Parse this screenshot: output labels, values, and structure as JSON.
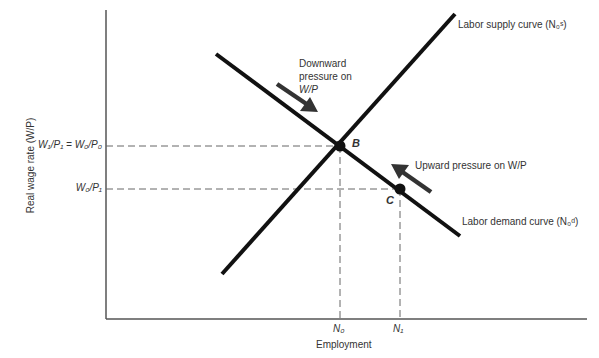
{
  "diagram": {
    "y_axis_label": "Real wage rate (W/P)",
    "x_axis_label": "Employment",
    "y_ticks": [
      {
        "id": "w1p1_eq_w0p0",
        "label": "W₁/P₁ = W₀/P₀"
      },
      {
        "id": "w0p1",
        "label": "W₀/P₁"
      }
    ],
    "x_ticks": [
      {
        "id": "n0",
        "label": "N₀"
      },
      {
        "id": "n1",
        "label": "N₁"
      }
    ],
    "curves": [
      {
        "id": "supply",
        "label": "Labor supply curve (N₀ˢ)"
      },
      {
        "id": "demand",
        "label": "Labor demand curve (N₀ᵈ)"
      }
    ],
    "points": [
      {
        "id": "B",
        "label": "B"
      },
      {
        "id": "C",
        "label": "C"
      }
    ],
    "annotations": [
      {
        "id": "downward",
        "lines": [
          "Downward",
          "pressure on",
          "W/P"
        ]
      },
      {
        "id": "upward",
        "label": "Upward pressure on W/P"
      }
    ],
    "colors": {
      "curve": "#111111",
      "axis": "#555555",
      "guide": "#666666",
      "arrow": "#333333"
    }
  }
}
